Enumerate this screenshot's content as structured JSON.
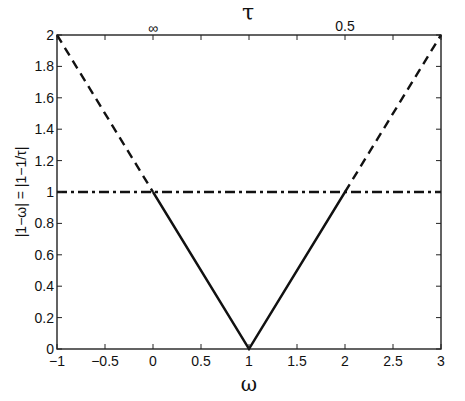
{
  "chart_data": {
    "type": "line",
    "title": "τ",
    "xlabel": "ω",
    "ylabel": "|1−ω| = |1−1/τ|",
    "xlim": [
      -1,
      3
    ],
    "ylim": [
      0,
      2
    ],
    "grid": false,
    "x_ticks": [
      -1,
      -0.5,
      0,
      0.5,
      1,
      1.5,
      2,
      2.5,
      3
    ],
    "x_tick_labels": [
      "−1",
      "−0.5",
      "0",
      "0.5",
      "1",
      "1.5",
      "2",
      "2.5",
      "3"
    ],
    "y_ticks": [
      0,
      0.2,
      0.4,
      0.6,
      0.8,
      1,
      1.2,
      1.4,
      1.6,
      1.8,
      2
    ],
    "y_tick_labels": [
      "0",
      "0.2",
      "0.4",
      "0.6",
      "0.8",
      "1",
      "1.2",
      "1.4",
      "1.6",
      "1.8",
      "2"
    ],
    "top_axis": {
      "label": "τ",
      "annotations": [
        {
          "x": 0,
          "text": "∞"
        },
        {
          "x": 2,
          "text": "0.5"
        }
      ]
    },
    "series": [
      {
        "name": "left-dashed",
        "style": "dashed",
        "x": [
          -1,
          0
        ],
        "y": [
          2,
          1
        ]
      },
      {
        "name": "solid-v",
        "style": "solid",
        "x": [
          0,
          1,
          2
        ],
        "y": [
          1,
          0,
          1
        ]
      },
      {
        "name": "right-dashed",
        "style": "dashed",
        "x": [
          2,
          3
        ],
        "y": [
          1,
          2
        ]
      },
      {
        "name": "unity-line",
        "style": "dashdot",
        "x": [
          -1,
          3
        ],
        "y": [
          1,
          1
        ]
      }
    ]
  }
}
